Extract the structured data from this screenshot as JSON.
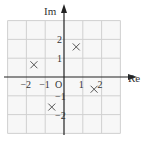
{
  "chart_data": {
    "type": "scatter",
    "title": "",
    "xlabel": "Re",
    "ylabel": "Im",
    "xlim": [
      -3,
      3
    ],
    "ylim": [
      -3,
      3
    ],
    "grid": true,
    "grid_step": 1,
    "x_ticks": [
      {
        "value": -2,
        "label": "−2"
      },
      {
        "value": -1,
        "label": "−1"
      },
      {
        "value": 1,
        "label": "1"
      },
      {
        "value": 2,
        "label": "2"
      }
    ],
    "y_ticks": [
      {
        "value": 2,
        "label": "2"
      },
      {
        "value": 1,
        "label": "1"
      },
      {
        "value": -1,
        "label": "−1"
      },
      {
        "value": -2,
        "label": "−2"
      }
    ],
    "origin_label": "O",
    "marker": "cross",
    "points": [
      {
        "x": 0.65,
        "y": 1.6
      },
      {
        "x": -1.6,
        "y": 0.65
      },
      {
        "x": -0.65,
        "y": -1.6
      },
      {
        "x": 1.6,
        "y": -0.65
      }
    ]
  },
  "colors": {
    "grid": "#d0d0d0",
    "axis": "#222222",
    "marker": "#555555",
    "background_cell": "#f7f7f7"
  }
}
